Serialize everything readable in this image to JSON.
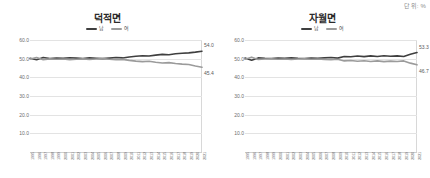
{
  "unit_note": "단위: %",
  "legend": {
    "male_label": "남",
    "female_label": "여",
    "male_color": "#3f3f3f",
    "female_color": "#9b9b9b"
  },
  "axis": {
    "y_ticks": [
      "60.0",
      "50.0",
      "40.0",
      "30.0",
      "20.0",
      "10.0"
    ],
    "y_min": 0,
    "y_max": 60,
    "x_ticks": [
      "1995",
      "1996",
      "1997",
      "1998",
      "1999",
      "2000",
      "2001",
      "2002",
      "2003",
      "2004",
      "2005",
      "2006",
      "2007",
      "2008",
      "2009",
      "2010",
      "2011",
      "2012",
      "2013",
      "2014",
      "2015",
      "2016",
      "2017",
      "2018",
      "2019",
      "2020",
      "2021"
    ]
  },
  "charts": [
    {
      "title": "덕적면",
      "end_label_male": "54.0",
      "end_label_female": "45.4"
    },
    {
      "title": "자월면",
      "end_label_male": "53.3",
      "end_label_female": "46.7"
    }
  ],
  "chart_data": [
    {
      "type": "line",
      "title": "덕적면",
      "xlabel": "",
      "ylabel": "",
      "unit": "%",
      "ylim": [
        0,
        60
      ],
      "grid": true,
      "legend_position": "top-center",
      "x": [
        1995,
        1996,
        1997,
        1998,
        1999,
        2000,
        2001,
        2002,
        2003,
        2004,
        2005,
        2006,
        2007,
        2008,
        2009,
        2010,
        2011,
        2012,
        2013,
        2014,
        2015,
        2016,
        2017,
        2018,
        2019,
        2020,
        2021
      ],
      "series": [
        {
          "name": "남",
          "color": "#3f3f3f",
          "values": [
            50.2,
            49.4,
            50.6,
            50.1,
            50.3,
            50.2,
            50.5,
            50.3,
            50.1,
            50.4,
            50.2,
            50.0,
            50.3,
            50.6,
            50.4,
            50.9,
            51.3,
            51.6,
            51.4,
            51.9,
            52.3,
            52.1,
            52.6,
            52.9,
            53.1,
            53.5,
            54.0
          ]
        },
        {
          "name": "여",
          "color": "#9b9b9b",
          "values": [
            49.8,
            50.6,
            49.4,
            49.9,
            49.7,
            49.8,
            49.5,
            49.7,
            49.9,
            49.6,
            49.8,
            50.0,
            49.7,
            49.4,
            49.6,
            49.1,
            48.7,
            48.4,
            48.6,
            48.1,
            47.7,
            47.9,
            47.4,
            47.1,
            46.9,
            46.1,
            45.4
          ]
        }
      ]
    },
    {
      "type": "line",
      "title": "자월면",
      "xlabel": "",
      "ylabel": "",
      "unit": "%",
      "ylim": [
        0,
        60
      ],
      "grid": true,
      "legend_position": "top-center",
      "x": [
        1995,
        1996,
        1997,
        1998,
        1999,
        2000,
        2001,
        2002,
        2003,
        2004,
        2005,
        2006,
        2007,
        2008,
        2009,
        2010,
        2011,
        2012,
        2013,
        2014,
        2015,
        2016,
        2017,
        2018,
        2019,
        2020,
        2021
      ],
      "series": [
        {
          "name": "남",
          "color": "#3f3f3f",
          "values": [
            50.3,
            49.2,
            50.4,
            50.2,
            50.1,
            50.3,
            50.2,
            50.4,
            50.2,
            50.1,
            50.3,
            50.2,
            50.4,
            50.6,
            50.3,
            51.2,
            51.0,
            51.4,
            51.1,
            51.5,
            51.2,
            51.6,
            51.3,
            51.5,
            51.2,
            52.4,
            53.3
          ]
        },
        {
          "name": "여",
          "color": "#9b9b9b",
          "values": [
            49.7,
            50.8,
            49.6,
            49.8,
            49.9,
            49.7,
            49.8,
            49.6,
            49.8,
            49.9,
            49.7,
            49.8,
            49.6,
            49.4,
            49.7,
            48.8,
            49.0,
            48.6,
            48.9,
            48.5,
            48.8,
            48.4,
            48.7,
            48.5,
            48.8,
            47.6,
            46.7
          ]
        }
      ]
    }
  ]
}
